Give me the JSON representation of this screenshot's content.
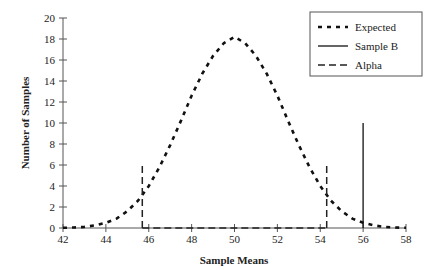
{
  "chart_data": {
    "type": "line",
    "title": "",
    "xlabel": "Sample Means",
    "ylabel": "Number of Samples",
    "xlim": [
      42,
      58
    ],
    "ylim": [
      0,
      20
    ],
    "xticks": [
      42,
      44,
      46,
      48,
      50,
      52,
      54,
      56,
      58
    ],
    "yticks": [
      0,
      2,
      4,
      6,
      8,
      10,
      12,
      14,
      16,
      18,
      20
    ],
    "grid": false,
    "legend_position": "upper right",
    "legend": [
      "Expected",
      "Sample B",
      "Alpha"
    ],
    "series": [
      {
        "name": "Expected",
        "style": "dotted-thick",
        "x": [
          42,
          42.5,
          43,
          43.5,
          44,
          44.5,
          45,
          45.5,
          46,
          46.5,
          47,
          47.5,
          48,
          48.5,
          49,
          49.5,
          50,
          50.5,
          51,
          51.5,
          52,
          52.5,
          53,
          53.5,
          54,
          54.5,
          55,
          55.5,
          56,
          56.5,
          57,
          57.5,
          58
        ],
        "y": [
          0.02,
          0.05,
          0.1,
          0.25,
          0.5,
          0.9,
          1.6,
          2.6,
          4.0,
          5.8,
          7.9,
          10.2,
          12.6,
          14.7,
          16.4,
          17.6,
          18.2,
          17.6,
          16.4,
          14.7,
          12.6,
          10.2,
          7.9,
          5.8,
          4.0,
          2.6,
          1.6,
          0.9,
          0.5,
          0.25,
          0.1,
          0.05,
          0.02
        ]
      },
      {
        "name": "Sample B",
        "style": "solid",
        "x": [
          56,
          56
        ],
        "y": [
          0,
          10
        ]
      },
      {
        "name": "Alpha",
        "style": "dashed",
        "segments": [
          {
            "x": [
              45.7,
              45.7
            ],
            "y": [
              0,
              6
            ]
          },
          {
            "x": [
              45.7,
              54.3
            ],
            "y": [
              0,
              0
            ]
          },
          {
            "x": [
              54.3,
              54.3
            ],
            "y": [
              0,
              6
            ]
          }
        ]
      }
    ]
  }
}
